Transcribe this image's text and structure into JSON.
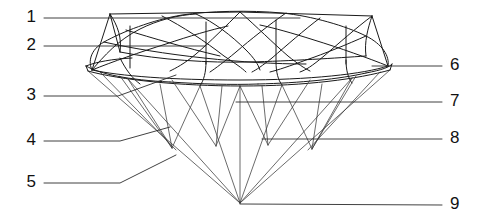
{
  "figure": {
    "background_color": "#ffffff",
    "line_color": "#1a1a1a",
    "label_color": "#111111"
  },
  "callouts": {
    "left": [
      {
        "id": "callout-1",
        "label": "1",
        "label_x": 36,
        "label_y": 18,
        "path": "M 44 18 L 300 18"
      },
      {
        "id": "callout-2",
        "label": "2",
        "label_x": 36,
        "label_y": 46,
        "path": "M 44 46 L 205 46"
      },
      {
        "id": "callout-3",
        "label": "3",
        "label_x": 36,
        "label_y": 96,
        "path": "M 44 96 L 118 96 L 176 75"
      },
      {
        "id": "callout-4",
        "label": "4",
        "label_x": 36,
        "label_y": 141,
        "path": "M 44 141 L 120 141 L 170 127"
      },
      {
        "id": "callout-5",
        "label": "5",
        "label_x": 36,
        "label_y": 183,
        "path": "M 44 183 L 120 183 L 176 155"
      }
    ],
    "right": [
      {
        "id": "callout-6",
        "label": "6",
        "label_x": 450,
        "label_y": 66,
        "path": "M 442 66 L 372 66"
      },
      {
        "id": "callout-7",
        "label": "7",
        "label_x": 450,
        "label_y": 102,
        "path": "M 442 102 L 236 102"
      },
      {
        "id": "callout-8",
        "label": "8",
        "label_x": 450,
        "label_y": 139,
        "path": "M 442 139 L 262 139"
      },
      {
        "id": "callout-9",
        "label": "9",
        "label_x": 450,
        "label_y": 205,
        "path": "M 442 205 L 240 204"
      }
    ]
  },
  "gem_geometry": {
    "description": "Outline and facet edges of a round brilliant cut shown in three-quarter perspective",
    "culet": {
      "x": 240,
      "y": 203
    },
    "girdle_y_top": 62,
    "girdle_y_bottom": 71,
    "table_y": 14,
    "crown_paths": [
      "M 92 70 C 88 62 90 50 104 42 C 122 32 152 20 182 15 C 208 11 250 10 282 13 C 312 16 346 26 366 36 C 382 44 390 56 388 66",
      "M 92 70 C 120 76 170 80 240 80 C 310 80 364 74 388 66",
      "M 110 14 L 240 12 L 372 16",
      "M 110 14 C 118 26 122 38 120 52",
      "M 372 16 C 368 28 364 42 366 56",
      "M 120 52 C 160 60 210 63 248 62 C 292 61 336 58 366 56",
      "M 110 14 L 92 70",
      "M 372 16 L 388 66",
      "M 110 14 L 120 52",
      "M 130 26 L 130 68",
      "M 206 22 L 206 64",
      "M 276 20 L 276 62",
      "M 346 26 L 346 64",
      "M 92 70 C 104 56 118 40 140 29 C 158 20 178 15 196 14",
      "M 196 14 C 214 22 232 36 246 50 C 254 58 258 64 260 70",
      "M 162 16 C 182 26 206 42 224 56 C 236 64 242 68 246 72",
      "M 240 12 C 226 26 210 42 196 54 C 184 64 176 68 170 71",
      "M 240 12 C 256 26 274 44 288 56 C 298 64 304 68 310 71",
      "M 286 13 C 270 24 250 40 236 52 C 224 62 216 68 210 72",
      "M 320 18 C 304 30 286 46 272 58 C 262 66 256 70 252 72",
      "M 372 16 C 356 28 338 44 324 56 C 312 66 306 70 300 72",
      "M 366 36 C 348 44 324 54 306 60 C 290 66 278 70 270 72",
      "M 92 70 C 112 62 140 52 166 44 C 190 36 210 30 228 26",
      "M 104 42 C 130 48 166 54 204 58 C 240 62 276 64 306 64",
      "M 126 30 C 152 38 186 48 220 56",
      "M 388 66 C 368 58 340 48 314 40 C 292 33 274 28 260 25"
    ],
    "girdle_paths": [
      "M 86 66 C 96 62 112 59 132 58",
      "M 86 66 C 100 74 128 80 170 82",
      "M 170 82 C 200 84 232 85 258 84",
      "M 258 84 C 300 83 340 79 366 73",
      "M 366 73 C 382 70 390 67 392 64",
      "M 86 66 L 88 71",
      "M 392 64 L 390 70",
      "M 88 71 C 120 80 180 86 242 86 C 306 86 358 79 390 70",
      "M 120 58 C 126 70 132 78 140 84",
      "M 206 62 C 206 72 204 80 200 86",
      "M 276 62 C 276 72 278 80 282 85",
      "M 346 60 C 346 70 348 78 352 83"
    ],
    "pavilion_paths": [
      "M 88 71 L 240 203",
      "M 390 70 L 240 203",
      "M 128 79 L 240 203",
      "M 352 78 L 240 203",
      "M 200 86 L 240 203",
      "M 282 85 L 240 203",
      "M 160 84 L 172 148",
      "M 172 148 L 128 79",
      "M 172 148 L 200 86",
      "M 240 86 L 240 203",
      "M 222 86 L 216 146",
      "M 216 146 L 172 80",
      "M 216 146 L 240 86",
      "M 262 86 L 268 145",
      "M 268 145 L 310 80",
      "M 268 145 L 240 86",
      "M 322 84 L 312 149",
      "M 312 149 L 352 78",
      "M 312 149 L 282 85",
      "M 120 76 L 172 148",
      "M 356 76 L 312 149",
      "M 100 72 L 176 150",
      "M 380 72 L 308 150"
    ]
  }
}
